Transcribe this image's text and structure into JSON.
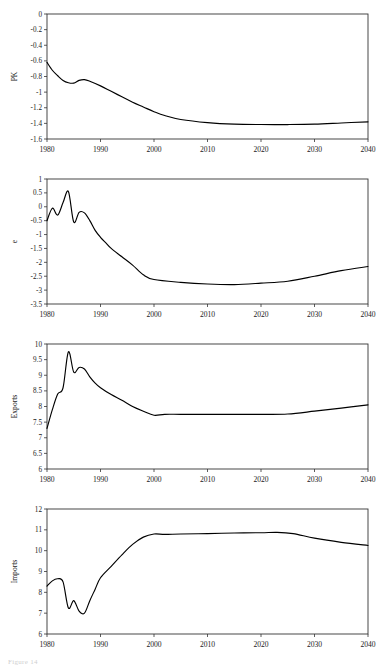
{
  "figure": {
    "caption": "Figure 14",
    "panel_count": 4,
    "x_axis": {
      "label": "",
      "ticks": [
        1980,
        1990,
        2000,
        2010,
        2020,
        2030,
        2040
      ],
      "tick_labels": [
        "1980",
        "1990",
        "2000",
        "2010",
        "2020",
        "2030",
        "2040"
      ],
      "min": 1980,
      "max": 2040
    },
    "line_color": "#000000",
    "frame_color": "#333333"
  },
  "chart_data": [
    {
      "type": "line",
      "title": "",
      "xlabel": "",
      "ylabel": "PK",
      "xlim": [
        1980,
        2040
      ],
      "ylim": [
        -1.6,
        0
      ],
      "grid": false,
      "legend": "none",
      "yticks": [
        0,
        -0.2,
        -0.4,
        -0.6,
        -0.8,
        -1,
        -1.2,
        -1.4,
        -1.6
      ],
      "ytick_labels": [
        "0",
        "-0.2",
        "-0.4",
        "-0.6",
        "-0.8",
        "-1",
        "-1.2",
        "-1.4",
        "-1.6"
      ],
      "xticks": [
        1980,
        1990,
        2000,
        2010,
        2020,
        2030,
        2040
      ],
      "xtick_labels": [
        "1980",
        "1990",
        "2000",
        "2010",
        "2020",
        "2030",
        "2040"
      ],
      "series": [
        {
          "name": "PK",
          "x": [
            1980,
            1981,
            1982,
            1983,
            1984,
            1985,
            1986,
            1987,
            1988,
            1990,
            1992,
            1994,
            1996,
            1998,
            2000,
            2002,
            2005,
            2010,
            2015,
            2020,
            2025,
            2030,
            2035,
            2040
          ],
          "values": [
            -0.62,
            -0.72,
            -0.79,
            -0.85,
            -0.88,
            -0.885,
            -0.85,
            -0.84,
            -0.86,
            -0.92,
            -0.99,
            -1.06,
            -1.13,
            -1.19,
            -1.25,
            -1.3,
            -1.35,
            -1.39,
            -1.41,
            -1.415,
            -1.415,
            -1.41,
            -1.395,
            -1.38
          ]
        }
      ]
    },
    {
      "type": "line",
      "title": "",
      "xlabel": "",
      "ylabel": "e",
      "xlim": [
        1980,
        2040
      ],
      "ylim": [
        -3.5,
        1
      ],
      "grid": false,
      "legend": "none",
      "yticks": [
        1,
        0.5,
        0,
        -0.5,
        -1,
        -1.5,
        -2,
        -2.5,
        -3,
        -3.5
      ],
      "ytick_labels": [
        "1",
        "0.5",
        "0",
        "-0.5",
        "-1",
        "-1.5",
        "-2",
        "-2.5",
        "-3",
        "-3.5"
      ],
      "xticks": [
        1980,
        1990,
        2000,
        2010,
        2020,
        2030,
        2040
      ],
      "xtick_labels": [
        "1980",
        "1990",
        "2000",
        "2010",
        "2020",
        "2030",
        "2040"
      ],
      "series": [
        {
          "name": "e",
          "x": [
            1980,
            1981,
            1982,
            1983,
            1984,
            1985,
            1986,
            1987,
            1988,
            1989,
            1990,
            1991,
            1992,
            1994,
            1996,
            1998,
            2000,
            2005,
            2010,
            2015,
            2020,
            2025,
            2030,
            2035,
            2040
          ],
          "values": [
            -0.5,
            -0.05,
            -0.3,
            0.15,
            0.55,
            -0.55,
            -0.2,
            -0.22,
            -0.5,
            -0.85,
            -1.1,
            -1.3,
            -1.5,
            -1.8,
            -2.1,
            -2.45,
            -2.62,
            -2.72,
            -2.78,
            -2.8,
            -2.75,
            -2.68,
            -2.5,
            -2.3,
            -2.15
          ]
        }
      ]
    },
    {
      "type": "line",
      "title": "",
      "xlabel": "",
      "ylabel": "Exports",
      "xlim": [
        1980,
        2040
      ],
      "ylim": [
        6,
        10
      ],
      "grid": false,
      "legend": "none",
      "yticks": [
        10,
        9.5,
        9,
        8.5,
        8,
        7.5,
        7,
        6.5,
        6
      ],
      "ytick_labels": [
        "10",
        "9.5",
        "9",
        "8.5",
        "8",
        "7.5",
        "7",
        "6.5",
        "6"
      ],
      "xticks": [
        1980,
        1990,
        2000,
        2010,
        2020,
        2030,
        2040
      ],
      "xtick_labels": [
        "1980",
        "1990",
        "2000",
        "2010",
        "2020",
        "2030",
        "2040"
      ],
      "series": [
        {
          "name": "Exports",
          "x": [
            1980,
            1981,
            1982,
            1983,
            1984,
            1985,
            1986,
            1987,
            1988,
            1989,
            1990,
            1992,
            1994,
            1996,
            1998,
            2000,
            2002,
            2005,
            2010,
            2015,
            2020,
            2025,
            2030,
            2035,
            2040
          ],
          "values": [
            7.3,
            7.9,
            8.4,
            8.6,
            9.75,
            9.1,
            9.25,
            9.2,
            8.95,
            8.75,
            8.6,
            8.38,
            8.2,
            8.0,
            7.85,
            7.72,
            7.75,
            7.75,
            7.75,
            7.75,
            7.75,
            7.76,
            7.85,
            7.95,
            8.05
          ]
        }
      ]
    },
    {
      "type": "line",
      "title": "",
      "xlabel": "",
      "ylabel": "Imports",
      "xlim": [
        1980,
        2040
      ],
      "ylim": [
        6,
        12
      ],
      "grid": false,
      "legend": "none",
      "yticks": [
        12,
        11,
        10,
        9,
        8,
        7,
        6
      ],
      "ytick_labels": [
        "12",
        "11",
        "10",
        "9",
        "8",
        "7",
        "6"
      ],
      "xticks": [
        1980,
        1990,
        2000,
        2010,
        2020,
        2030,
        2040
      ],
      "xtick_labels": [
        "1980",
        "1990",
        "2000",
        "2010",
        "2020",
        "2030",
        "2040"
      ],
      "series": [
        {
          "name": "Imports",
          "x": [
            1980,
            1981,
            1982,
            1983,
            1984,
            1985,
            1986,
            1987,
            1988,
            1989,
            1990,
            1992,
            1994,
            1996,
            1998,
            2000,
            2002,
            2005,
            2010,
            2015,
            2020,
            2023,
            2026,
            2030,
            2035,
            2040
          ],
          "values": [
            8.3,
            8.55,
            8.65,
            8.5,
            7.25,
            7.6,
            7.1,
            7.0,
            7.6,
            8.15,
            8.7,
            9.25,
            9.8,
            10.3,
            10.65,
            10.8,
            10.78,
            10.8,
            10.82,
            10.85,
            10.86,
            10.88,
            10.82,
            10.6,
            10.4,
            10.25
          ]
        }
      ]
    }
  ]
}
